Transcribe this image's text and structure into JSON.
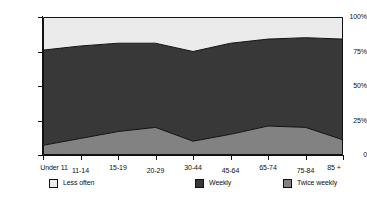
{
  "chart_data": {
    "type": "area",
    "title": "",
    "subtitle": "",
    "xlabel": "",
    "ylabel": "",
    "stacked": true,
    "percent_stacked": true,
    "grid": false,
    "legend_position": "bottom",
    "ylim": [
      0,
      100
    ],
    "y_ticks": [
      {
        "value": 0,
        "label": "0"
      },
      {
        "value": 25,
        "label": "25%"
      },
      {
        "value": 50,
        "label": "50%"
      },
      {
        "value": 75,
        "label": "75%"
      },
      {
        "value": 100,
        "label": "100%"
      }
    ],
    "categories": [
      "Under 11",
      "11-14",
      "15-19",
      "20-29",
      "30-44",
      "45-64",
      "65-74",
      "75-84",
      "85 +"
    ],
    "series": [
      {
        "name": "Twice weekly",
        "color": "#828282",
        "stack_order": 1,
        "values": [
          7,
          12,
          17,
          20,
          10,
          15,
          21,
          20,
          11
        ]
      },
      {
        "name": "Weekly",
        "color": "#383838",
        "stack_order": 2,
        "values": [
          69,
          67,
          64,
          61,
          65,
          66,
          63,
          65,
          73
        ]
      },
      {
        "name": "Less often",
        "color": "#ebebeb",
        "stack_order": 3,
        "values": [
          24,
          21,
          19,
          19,
          25,
          19,
          16,
          15,
          16
        ]
      }
    ],
    "cumulative_boundaries": [
      {
        "name": "Twice weekly top",
        "values": [
          7,
          12,
          17,
          20,
          10,
          15,
          21,
          20,
          11
        ]
      },
      {
        "name": "Weekly top",
        "values": [
          76,
          79,
          81,
          81,
          75,
          81,
          84,
          85,
          84
        ]
      },
      {
        "name": "Less often top",
        "values": [
          100,
          100,
          100,
          100,
          100,
          100,
          100,
          100,
          100
        ]
      }
    ],
    "legend": [
      {
        "label": "Less often",
        "color": "#ebebeb"
      },
      {
        "label": "Weekly",
        "color": "#383838"
      },
      {
        "label": "Twice weekly",
        "color": "#828282"
      }
    ],
    "axis_color": "#111111",
    "plot_border_color": "#111111",
    "background_color": "#ffffff"
  }
}
